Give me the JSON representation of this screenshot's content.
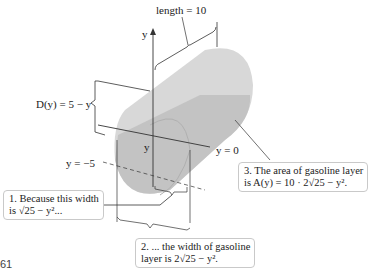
{
  "figure": {
    "number_fragment": "61",
    "labels": {
      "length": "length = 10",
      "y_axis": "y",
      "depth": "D(y) = 5 − y",
      "y_inside": "y",
      "y_zero": "y = 0",
      "y_minus5": "y = −5"
    },
    "callouts": [
      {
        "id": 1,
        "line1": "1. Because this width",
        "line2": "is √25 − y²..."
      },
      {
        "id": 2,
        "line1": "2. ... the width of gasoline",
        "line2": "layer is 2√25 − y²."
      },
      {
        "id": 3,
        "line1": "3. The area of gasoline layer",
        "line2": "is A(y) = 10 · 2√25 − y²."
      }
    ],
    "colors": {
      "cylinder": "#d6d6d6",
      "gasoline_layer": "#b9b9b9",
      "lines": "#333333",
      "callout_border": "#c9c9c9"
    }
  }
}
